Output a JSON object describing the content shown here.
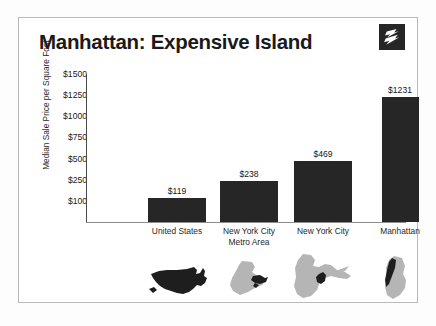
{
  "card": {
    "title": "Manhattan: Expensive Island",
    "logo_name": "zillow-z-logo",
    "border_color": "#b9b9b9",
    "background": "#ffffff"
  },
  "chart_data": {
    "type": "bar",
    "title": "Manhattan: Expensive Island",
    "xlabel": "",
    "ylabel": "Median Sale Price per Square Foot",
    "categories": [
      "United States",
      "New York City\nMetro Area",
      "New York City",
      "Manhattan"
    ],
    "values": [
      119,
      238,
      469,
      1231
    ],
    "value_labels": [
      "$119",
      "$238",
      "$469",
      "$1231"
    ],
    "ytick_labels": [
      "$1500",
      "$1250",
      "$1000",
      "$750",
      "$500",
      "$250",
      "$100"
    ],
    "ytick_values": [
      1500,
      1250,
      1000,
      750,
      500,
      250,
      100
    ],
    "ylim": [
      0,
      1500
    ],
    "grid": false,
    "legend": "none",
    "bar_color": "#262626",
    "axis_color": "#4a4a4a"
  },
  "maps": [
    {
      "name": "map-united-states",
      "caption": "United States"
    },
    {
      "name": "map-nyc-metro-area",
      "caption": "New York City Metro Area"
    },
    {
      "name": "map-new-york-city",
      "caption": "New York City"
    },
    {
      "name": "map-manhattan",
      "caption": "Manhattan"
    }
  ],
  "colors": {
    "map_light": "#b5b5b5",
    "map_dark": "#1e1e1e",
    "text": "#1a1a1a"
  }
}
